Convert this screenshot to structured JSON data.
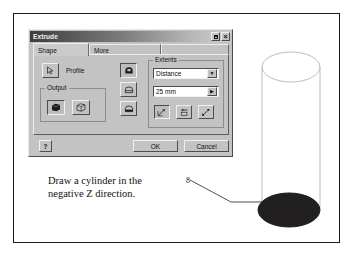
{
  "figure": {
    "caption_lines": [
      "Draw a cylinder in the",
      "negative Z direction."
    ],
    "callout_label": "8"
  },
  "dialog": {
    "title": "Extrude",
    "titlebar_buttons": [
      {
        "name": "restore",
        "glyph": ""
      },
      {
        "name": "close",
        "glyph": "×"
      }
    ],
    "tabs": [
      {
        "label": "Shape",
        "active": true
      },
      {
        "label": "More",
        "active": false
      }
    ],
    "shape_tab": {
      "profile": {
        "button_icon": "cursor-arrow-icon",
        "label": "Profile"
      },
      "output": {
        "legend": "Output",
        "buttons": [
          {
            "name": "solid",
            "icon": "solid-cube-icon",
            "selected": true
          },
          {
            "name": "surface",
            "icon": "surface-cube-icon",
            "selected": false
          }
        ]
      },
      "operation_buttons": [
        {
          "name": "join",
          "icon": "join-icon",
          "selected": true
        },
        {
          "name": "cut",
          "icon": "cut-icon",
          "selected": false
        },
        {
          "name": "intersect",
          "icon": "intersect-icon",
          "selected": false
        }
      ],
      "extents": {
        "legend": "Extents",
        "type_value": "Distance",
        "distance_value": "25 mm",
        "direction_buttons": [
          {
            "name": "direction-positive",
            "icon": "arrow-up-right-icon",
            "selected": true
          },
          {
            "name": "direction-negative",
            "icon": "arrow-left-icon",
            "selected": false
          },
          {
            "name": "direction-symmetric",
            "icon": "arrow-both-icon",
            "selected": false
          }
        ]
      }
    },
    "footer": {
      "help_label": "?",
      "ok_label": "OK",
      "cancel_label": "Cancel"
    }
  },
  "colors": {
    "dialog_face": "#c3c3c3",
    "titlebar_start": "#3d3d3d",
    "titlebar_end": "#cfcfcf",
    "frame_border": "#1a1a1a",
    "cylinder_outline": "#b9b9b9",
    "cylinder_bottom_fill": "#211f1f"
  }
}
